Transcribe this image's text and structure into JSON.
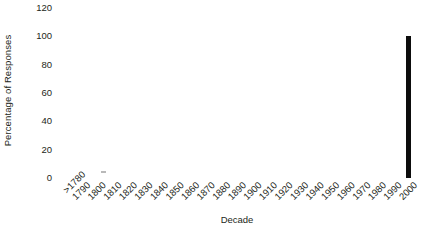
{
  "chart_data": {
    "type": "bar",
    "title": "",
    "xlabel": "Decade",
    "ylabel": "Percentage of Responses",
    "categories": [
      ">1780",
      "1790",
      "1800",
      "1810",
      "1820",
      "1830",
      "1840",
      "1850",
      "1860",
      "1870",
      "1880",
      "1890",
      "1900",
      "1910",
      "1920",
      "1930",
      "1940",
      "1950",
      "1960",
      "1970",
      "1980",
      "1990",
      "2000"
    ],
    "values": [
      0,
      0,
      0,
      0,
      0,
      0,
      0,
      0,
      0,
      0,
      0,
      0,
      0,
      0,
      0,
      0,
      0,
      0,
      0,
      0,
      0,
      0,
      100
    ],
    "ylim": [
      0,
      120
    ],
    "yticks": [
      0,
      20,
      40,
      60,
      80,
      100,
      120
    ],
    "ytick_labels": [
      "0",
      "20",
      "40",
      "60",
      "80",
      "100",
      "120"
    ],
    "grid": false,
    "legend": false,
    "axis_lines": false,
    "bar_color": "#0d0d0d",
    "text_color": "#231f20",
    "background": "#ffffff"
  }
}
